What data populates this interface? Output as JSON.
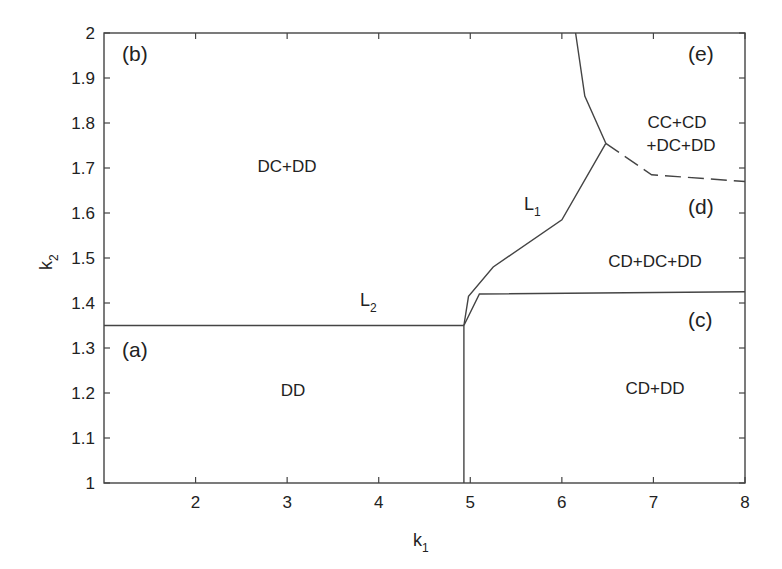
{
  "chart_data": {
    "type": "line",
    "title": "",
    "xlabel": "k",
    "xlabel_sub": "1",
    "ylabel": "k",
    "ylabel_sub": "2",
    "xlim": [
      1,
      8
    ],
    "ylim": [
      1,
      2
    ],
    "grid": false,
    "x_ticks": [
      "2",
      "3",
      "4",
      "5",
      "6",
      "7",
      "8"
    ],
    "x_tick_values": [
      2,
      3,
      4,
      5,
      6,
      7,
      8
    ],
    "y_ticks": [
      "1",
      "1.1",
      "1.2",
      "1.3",
      "1.4",
      "1.5",
      "1.6",
      "1.7",
      "1.8",
      "1.9",
      "2"
    ],
    "y_tick_values": [
      1,
      1.1,
      1.2,
      1.3,
      1.4,
      1.5,
      1.6,
      1.7,
      1.8,
      1.9,
      2
    ],
    "series": [
      {
        "name": "L2",
        "style": "solid",
        "points": [
          [
            1,
            1.35
          ],
          [
            4.93,
            1.35
          ]
        ]
      },
      {
        "name": "vertical-boundary",
        "style": "solid",
        "points": [
          [
            4.93,
            1.0
          ],
          [
            4.93,
            1.35
          ]
        ]
      },
      {
        "name": "c-d-boundary",
        "style": "solid",
        "points": [
          [
            4.93,
            1.35
          ],
          [
            5.1,
            1.42
          ],
          [
            8,
            1.425
          ]
        ]
      },
      {
        "name": "L1",
        "style": "solid",
        "points": [
          [
            4.93,
            1.35
          ],
          [
            4.98,
            1.415
          ],
          [
            5.25,
            1.48
          ],
          [
            6.0,
            1.585
          ],
          [
            6.48,
            1.755
          ]
        ]
      },
      {
        "name": "e-b-boundary",
        "style": "solid",
        "points": [
          [
            6.48,
            1.755
          ],
          [
            6.25,
            1.86
          ],
          [
            6.15,
            2.0
          ]
        ]
      },
      {
        "name": "e-d-boundary",
        "style": "dashed",
        "points": [
          [
            6.48,
            1.755
          ],
          [
            6.98,
            1.685
          ],
          [
            8,
            1.67
          ]
        ]
      }
    ],
    "annotations": [
      {
        "text": "(a)",
        "x": 1.25,
        "y": 1.295,
        "kind": "panel"
      },
      {
        "text": "(b)",
        "x": 1.25,
        "y": 1.955,
        "kind": "panel"
      },
      {
        "text": "(c)",
        "x": 7.6,
        "y": 1.34,
        "kind": "panel"
      },
      {
        "text": "(d)",
        "x": 7.6,
        "y": 1.63,
        "kind": "panel"
      },
      {
        "text": "(e)",
        "x": 7.6,
        "y": 1.955,
        "kind": "panel"
      },
      {
        "text": "DD",
        "x": 3.0,
        "y": 1.2,
        "kind": "region"
      },
      {
        "text": "DC+DD",
        "x": 3.0,
        "y": 1.7,
        "kind": "region"
      },
      {
        "text": "CD+DD",
        "x": 7.2,
        "y": 1.2,
        "kind": "region"
      },
      {
        "text": "CD+DC+DD",
        "x": 7.2,
        "y": 1.49,
        "kind": "region"
      },
      {
        "text": "CC+CD",
        "x": 7.35,
        "y": 1.81,
        "kind": "region"
      },
      {
        "text": "+DC+DD",
        "x": 7.35,
        "y": 1.76,
        "kind": "region"
      },
      {
        "text": "L",
        "sub": "1",
        "x": 5.6,
        "y": 1.62,
        "kind": "curve"
      },
      {
        "text": "L",
        "sub": "2",
        "x": 4.0,
        "y": 1.375,
        "kind": "curve"
      }
    ]
  },
  "panels": {
    "a": "(a)",
    "b": "(b)",
    "c": "(c)",
    "d": "(d)",
    "e": "(e)"
  },
  "regions": {
    "a": "DD",
    "b": "DC+DD",
    "c": "CD+DD",
    "d": "CD+DC+DD",
    "e_line1": "CC+CD",
    "e_line2": "+DC+DD"
  },
  "curves": {
    "L1": "L",
    "L1_sub": "1",
    "L2": "L",
    "L2_sub": "2"
  },
  "axes": {
    "x_label": "k",
    "x_sub": "1",
    "y_label": "k",
    "y_sub": "2"
  },
  "colors": {
    "line": "#444444",
    "text": "#222222",
    "background": "#ffffff"
  }
}
